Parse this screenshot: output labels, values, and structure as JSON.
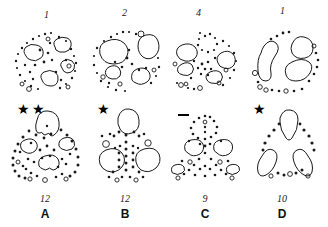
{
  "figure": {
    "type": "scientific-idiogram-grid",
    "rows": 2,
    "columns": 4,
    "background_color": "#ffffff",
    "ink_color": "#1a1a1a"
  },
  "top_row": [
    {
      "id": "panel-top-1",
      "number": "1",
      "shape": "circular",
      "large_blobs": 4,
      "small_dots": 34,
      "rings": 5
    },
    {
      "id": "panel-top-2",
      "number": "2",
      "shape": "circular",
      "large_blobs": 4,
      "small_dots": 26,
      "rings": 4
    },
    {
      "id": "panel-top-3",
      "number": "4",
      "shape": "circular",
      "large_blobs": 4,
      "small_dots": 30,
      "rings": 6
    },
    {
      "id": "panel-top-4",
      "number": "1",
      "shape": "circular",
      "large_blobs": 3,
      "small_dots": 18,
      "rings": 5
    }
  ],
  "bottom_row": [
    {
      "id": "panel-bottom-a",
      "letter": "A",
      "count": "12",
      "marker": "star",
      "marker_glyph": "★",
      "marker_repeat": 2,
      "shape": "arch",
      "large_blobs": 4,
      "small_dots": 40,
      "rings": 4
    },
    {
      "id": "panel-bottom-b",
      "letter": "B",
      "count": "12",
      "marker": "star",
      "marker_glyph": "★",
      "marker_repeat": 1,
      "shape": "arch",
      "large_blobs": 4,
      "small_dots": 30,
      "rings": 4
    },
    {
      "id": "panel-bottom-c",
      "letter": "C",
      "count": "9",
      "marker": "dash",
      "marker_glyph": "—",
      "marker_repeat": 1,
      "shape": "arch",
      "large_blobs": 4,
      "small_dots": 36,
      "rings": 5
    },
    {
      "id": "panel-bottom-d",
      "letter": "D",
      "count": "10",
      "marker": "star",
      "marker_glyph": "★",
      "marker_repeat": 1,
      "shape": "arch",
      "large_blobs": 3,
      "small_dots": 14,
      "rings": 3
    }
  ]
}
